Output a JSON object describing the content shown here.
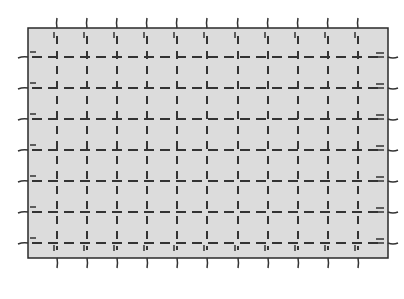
{
  "diagram": {
    "type": "grid-panel",
    "background_color": "#ffffff",
    "panel": {
      "x": 28,
      "y": 28,
      "width": 360,
      "height": 230,
      "fill": "#dcdcdc",
      "stroke": "#2a2a2a"
    },
    "grid_color": "#333333",
    "vertical_lines_x": [
      57,
      87,
      117,
      147,
      177,
      207,
      238,
      268,
      298,
      328,
      358
    ],
    "horizontal_lines_y": [
      57,
      88,
      119,
      150,
      181,
      212,
      243
    ]
  }
}
